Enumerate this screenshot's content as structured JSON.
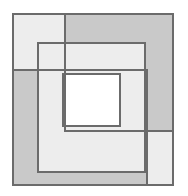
{
  "figure": {
    "title": "Overlapping squares geometric figure",
    "background_color": "#ffffff",
    "canvas": {
      "width": 188,
      "height": 196
    },
    "palette": {
      "light_fill": "#ededed",
      "mid_fill": "#c9c9c9",
      "dark_fill": "#bcbcbc",
      "white_fill": "#ffffff",
      "stroke": "#6b6b6b",
      "stroke_light": "#8a8a8a"
    },
    "stroke_width": 1.3,
    "shapes": [
      {
        "name": "outer-square-light",
        "role": "background light square spanning upper-left through lower-right",
        "x": 13,
        "y": 14,
        "width": 160,
        "height": 171,
        "fill": "#ededed",
        "stroke": "#6b6b6b"
      },
      {
        "name": "upper-right-square-shaded",
        "role": "medium gray square occupying upper-right band",
        "x": 65,
        "y": 14,
        "width": 108,
        "height": 117,
        "fill": "#c9c9c9",
        "stroke": "#6b6b6b"
      },
      {
        "name": "lower-left-square-shaded",
        "role": "medium gray square occupying lower-left band",
        "x": 13,
        "y": 70,
        "width": 134,
        "height": 115,
        "fill": "#c9c9c9",
        "stroke": "#6b6b6b"
      },
      {
        "name": "middle-square-outline",
        "role": "mid-size square outline crossing the shaded bands",
        "x": 38,
        "y": 43,
        "width": 107,
        "height": 129,
        "fill": "#ededed",
        "stroke": "#6b6b6b"
      },
      {
        "name": "inner-white-square",
        "role": "innermost white square core",
        "x": 63,
        "y": 74,
        "width": 57,
        "height": 52,
        "fill": "#ffffff",
        "stroke": "#6b6b6b"
      }
    ],
    "overlap_regions": [
      {
        "name": "upper-right-over-light",
        "fill": "#c9c9c9"
      },
      {
        "name": "lower-left-over-light",
        "fill": "#c9c9c9"
      },
      {
        "name": "double-shaded-band",
        "fill": "#bcbcbc"
      },
      {
        "name": "inner-core",
        "fill": "#ffffff"
      }
    ]
  }
}
